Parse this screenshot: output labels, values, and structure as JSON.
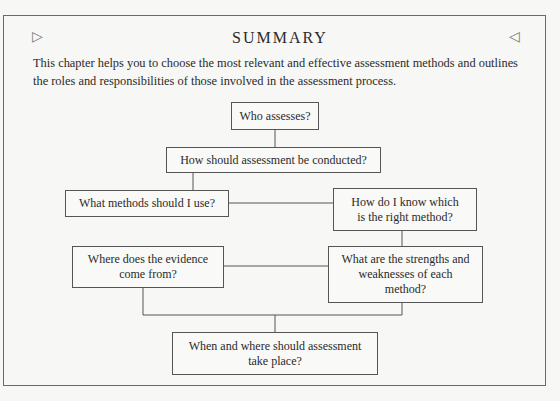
{
  "header": {
    "title": "SUMMARY",
    "left_marker_icon": "triangle-right-outline-icon",
    "right_marker_icon": "triangle-left-outline-icon",
    "left_marker": "▷",
    "right_marker": "◁"
  },
  "intro": "This chapter helps you to choose the most relevant and effective assessment methods and outlines the roles and responsibilities of those involved in the assessment process.",
  "flowchart": {
    "nodes": [
      {
        "id": "who",
        "label": "Who assesses?"
      },
      {
        "id": "how",
        "label": "How should assessment be conducted?"
      },
      {
        "id": "methods",
        "label": "What methods should I use?"
      },
      {
        "id": "right",
        "label": "How do I know which is the right method?"
      },
      {
        "id": "evidence",
        "label": "Where does the evidence come from?"
      },
      {
        "id": "strengths",
        "label": "What are the strengths and weaknesses of each method?"
      },
      {
        "id": "when",
        "label": "When and where should assessment take place?"
      }
    ],
    "edges": [
      [
        "who",
        "how"
      ],
      [
        "how",
        "methods"
      ],
      [
        "methods",
        "right"
      ],
      [
        "right",
        "strengths"
      ],
      [
        "strengths",
        "evidence"
      ],
      [
        "evidence",
        "when"
      ],
      [
        "strengths",
        "when"
      ]
    ]
  }
}
